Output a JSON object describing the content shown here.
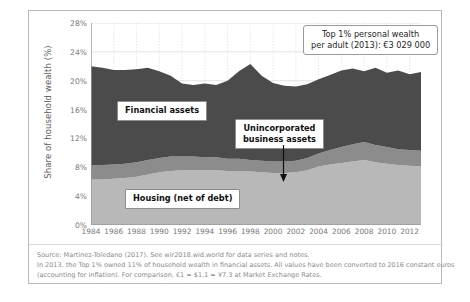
{
  "axis": {
    "y_title": "Share of household wealth (%)",
    "y_ticks": [
      "0%",
      "4%",
      "8%",
      "12%",
      "16%",
      "20%",
      "24%",
      "28%"
    ],
    "x_ticks": [
      "1984",
      "1986",
      "1988",
      "1990",
      "1992",
      "1994",
      "1996",
      "1998",
      "2000",
      "2002",
      "2004",
      "2006",
      "2008",
      "2010",
      "2012"
    ]
  },
  "callouts": {
    "financial": "Financial assets",
    "housing": "Housing (net of debt)",
    "business_line1": "Unincorporated",
    "business_line2": "business assets",
    "top1_line1": "Top 1% personal wealth",
    "top1_line2": "per adult (2013): €3 029 000"
  },
  "notes": {
    "line1": "Source: Martinez-Toledano (2017). See wir2018.wid.world for data series and notes.",
    "line2": "In 2013, the Top 1% owned 11% of household wealth in financial assets. All values have been converted to 2016 constant euros",
    "line3": "(accounting for inflation). For comparison, €1 = $1.1 = ¥7.3 at Market Exchange Rates."
  },
  "colors": {
    "financial": "#4b4b4b",
    "business": "#8c8c8c",
    "housing": "#b8b8b8",
    "grid": "#cfcfcf",
    "axis": "#9a9a9a",
    "text": "#777777"
  },
  "chart_data": {
    "type": "area",
    "title": "",
    "xlabel": "",
    "ylabel": "Share of household wealth (%)",
    "ylim": [
      0,
      28
    ],
    "xlim": [
      1984,
      2013
    ],
    "grid": true,
    "stacked": true,
    "legend": "inline-callouts",
    "x": [
      1984,
      1985,
      1986,
      1987,
      1988,
      1989,
      1990,
      1991,
      1992,
      1993,
      1994,
      1995,
      1996,
      1997,
      1998,
      1999,
      2000,
      2001,
      2002,
      2003,
      2004,
      2005,
      2006,
      2007,
      2008,
      2009,
      2010,
      2011,
      2012,
      2013
    ],
    "series": [
      {
        "name": "Housing (net of debt)",
        "values": [
          6.3,
          6.3,
          6.4,
          6.5,
          6.7,
          7.0,
          7.3,
          7.5,
          7.6,
          7.6,
          7.6,
          7.6,
          7.5,
          7.5,
          7.4,
          7.3,
          7.2,
          7.2,
          7.3,
          7.6,
          8.1,
          8.4,
          8.6,
          8.8,
          9.0,
          8.7,
          8.5,
          8.3,
          8.2,
          8.1
        ]
      },
      {
        "name": "Unincorporated business assets",
        "values": [
          2.0,
          2.0,
          2.0,
          2.0,
          2.0,
          2.0,
          2.0,
          2.0,
          1.9,
          1.9,
          1.8,
          1.8,
          1.7,
          1.7,
          1.6,
          1.6,
          1.6,
          1.6,
          1.6,
          1.7,
          1.8,
          2.0,
          2.2,
          2.4,
          2.5,
          2.4,
          2.3,
          2.2,
          2.2,
          2.2
        ]
      },
      {
        "name": "Financial assets",
        "values": [
          13.7,
          13.5,
          13.1,
          13.0,
          12.9,
          12.8,
          12.0,
          11.2,
          10.1,
          9.9,
          10.2,
          10.0,
          10.8,
          12.1,
          13.3,
          11.8,
          10.9,
          10.5,
          10.3,
          10.2,
          10.3,
          10.4,
          10.6,
          10.5,
          9.8,
          10.7,
          10.3,
          10.9,
          10.5,
          10.9
        ]
      }
    ],
    "totals": [
      22.0,
      21.8,
      21.5,
      21.5,
      21.6,
      21.8,
      21.3,
      20.7,
      19.6,
      19.4,
      19.6,
      19.4,
      20.0,
      21.3,
      22.3,
      20.7,
      19.7,
      19.3,
      19.2,
      19.5,
      20.2,
      20.8,
      21.4,
      21.7,
      21.3,
      21.8,
      21.1,
      21.4,
      20.9,
      21.2
    ]
  }
}
